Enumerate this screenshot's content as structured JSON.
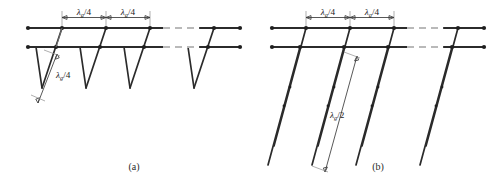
{
  "figure": {
    "background_color": "#ffffff",
    "line_color": "#2b2b2b",
    "dash_color": "#b9b9b9"
  },
  "panels": [
    {
      "id": "a",
      "caption": "(a)",
      "stub_type": "quarter-wave",
      "stub_length_label": {
        "symbol": "λ",
        "subscript": "g",
        "divider": "/4",
        "full": "λg/4"
      },
      "spacing_labels": [
        {
          "symbol": "λ",
          "subscript": "g",
          "divider": "/4",
          "full": "λg/4"
        },
        {
          "symbol": "λ",
          "subscript": "g",
          "divider": "/4",
          "full": "λg/4"
        }
      ],
      "stub_count_drawn": 4,
      "has_continuation_break": true
    },
    {
      "id": "b",
      "caption": "(b)",
      "stub_type": "half-wave",
      "stub_length_label": {
        "symbol": "λ",
        "subscript": "g",
        "divider": "/2",
        "full": "λg/2"
      },
      "spacing_labels": [
        {
          "symbol": "λ",
          "subscript": "g",
          "divider": "/4",
          "full": "λg/4"
        },
        {
          "symbol": "λ",
          "subscript": "g",
          "divider": "/4",
          "full": "λg/4"
        }
      ],
      "stub_count_drawn": 4,
      "has_continuation_break": true
    }
  ]
}
